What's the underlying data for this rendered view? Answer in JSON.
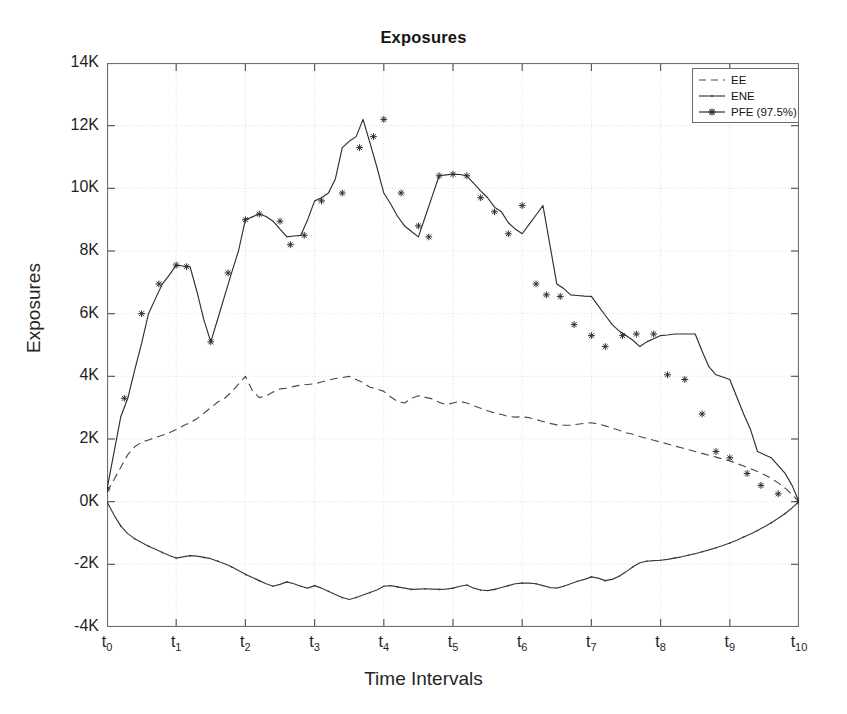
{
  "chart_data": {
    "type": "line",
    "title": "Exposures",
    "xlabel": "Time Intervals",
    "ylabel": "Exposures",
    "grid": true,
    "legend_position": "upper-right",
    "ylim": [
      -4000,
      14000
    ],
    "ytick_values": [
      -4000,
      -2000,
      0,
      2000,
      4000,
      6000,
      8000,
      10000,
      12000,
      14000
    ],
    "ytick_labels": [
      "-4K",
      "-2K",
      "0K",
      "2K",
      "4K",
      "6K",
      "8K",
      "10K",
      "12K",
      "14K"
    ],
    "xlim": [
      0,
      10
    ],
    "xtick_values": [
      0,
      1,
      2,
      3,
      4,
      5,
      6,
      7,
      8,
      9,
      10
    ],
    "xtick_labels": [
      "t0",
      "t1",
      "t2",
      "t3",
      "t4",
      "t5",
      "t6",
      "t7",
      "t8",
      "t9",
      "t10"
    ],
    "xtick_bases": [
      "t",
      "t",
      "t",
      "t",
      "t",
      "t",
      "t",
      "t",
      "t",
      "t",
      "t"
    ],
    "xtick_subs": [
      "0",
      "1",
      "2",
      "3",
      "4",
      "5",
      "6",
      "7",
      "8",
      "9",
      "10"
    ],
    "x": [
      0.0,
      0.1,
      0.2,
      0.3,
      0.4,
      0.5,
      0.6,
      0.7,
      0.8,
      0.9,
      1.0,
      1.1,
      1.2,
      1.3,
      1.4,
      1.5,
      1.6,
      1.7,
      1.8,
      1.9,
      2.0,
      2.1,
      2.2,
      2.3,
      2.4,
      2.5,
      2.6,
      2.7,
      2.8,
      2.9,
      3.0,
      3.1,
      3.2,
      3.3,
      3.4,
      3.5,
      3.6,
      3.7,
      3.8,
      3.9,
      4.0,
      4.1,
      4.2,
      4.3,
      4.4,
      4.5,
      4.6,
      4.7,
      4.8,
      4.9,
      5.0,
      5.1,
      5.2,
      5.3,
      5.4,
      5.5,
      5.6,
      5.7,
      5.8,
      5.9,
      6.0,
      6.1,
      6.2,
      6.3,
      6.4,
      6.5,
      6.6,
      6.7,
      6.8,
      6.9,
      7.0,
      7.1,
      7.2,
      7.3,
      7.4,
      7.5,
      7.6,
      7.7,
      7.8,
      7.9,
      8.0,
      8.1,
      8.2,
      8.3,
      8.4,
      8.5,
      8.6,
      8.7,
      8.8,
      8.9,
      9.0,
      9.1,
      9.2,
      9.3,
      9.4,
      9.5,
      9.6,
      9.7,
      9.8,
      9.9,
      10.0
    ],
    "series": [
      {
        "name": "EE",
        "style": "dashed",
        "marker": "none",
        "color": "#4a4a4a",
        "values": [
          300,
          700,
          1100,
          1500,
          1750,
          1900,
          1970,
          2050,
          2120,
          2200,
          2300,
          2420,
          2520,
          2650,
          2820,
          3000,
          3180,
          3300,
          3500,
          3750,
          4000,
          3550,
          3320,
          3380,
          3500,
          3600,
          3620,
          3680,
          3720,
          3740,
          3760,
          3820,
          3880,
          3930,
          3960,
          4000,
          3900,
          3800,
          3650,
          3600,
          3520,
          3340,
          3200,
          3150,
          3300,
          3380,
          3330,
          3280,
          3170,
          3100,
          3150,
          3200,
          3150,
          3060,
          2980,
          2900,
          2830,
          2780,
          2720,
          2700,
          2710,
          2680,
          2620,
          2560,
          2500,
          2450,
          2440,
          2440,
          2470,
          2500,
          2520,
          2480,
          2420,
          2350,
          2280,
          2200,
          2150,
          2080,
          2020,
          1960,
          1900,
          1840,
          1780,
          1720,
          1660,
          1600,
          1540,
          1480,
          1420,
          1360,
          1300,
          1220,
          1140,
          1050,
          960,
          860,
          740,
          600,
          430,
          230,
          0
        ]
      },
      {
        "name": "ENE",
        "style": "solid",
        "marker": "none",
        "color": "#3a3a3a",
        "values": [
          0,
          -420,
          -780,
          -1020,
          -1180,
          -1300,
          -1420,
          -1520,
          -1620,
          -1720,
          -1800,
          -1760,
          -1720,
          -1740,
          -1780,
          -1820,
          -1900,
          -1980,
          -2080,
          -2200,
          -2320,
          -2420,
          -2520,
          -2620,
          -2700,
          -2640,
          -2560,
          -2620,
          -2700,
          -2760,
          -2680,
          -2760,
          -2860,
          -2960,
          -3060,
          -3120,
          -3060,
          -2980,
          -2900,
          -2820,
          -2700,
          -2680,
          -2720,
          -2760,
          -2800,
          -2790,
          -2780,
          -2790,
          -2800,
          -2790,
          -2760,
          -2700,
          -2660,
          -2760,
          -2820,
          -2840,
          -2800,
          -2740,
          -2680,
          -2620,
          -2600,
          -2600,
          -2620,
          -2680,
          -2740,
          -2760,
          -2700,
          -2620,
          -2540,
          -2480,
          -2400,
          -2440,
          -2520,
          -2480,
          -2380,
          -2240,
          -2080,
          -1950,
          -1900,
          -1880,
          -1870,
          -1840,
          -1800,
          -1760,
          -1710,
          -1660,
          -1600,
          -1540,
          -1470,
          -1400,
          -1320,
          -1230,
          -1130,
          -1030,
          -920,
          -800,
          -670,
          -530,
          -380,
          -200,
          0
        ]
      },
      {
        "name": "PFE (97.5%)",
        "style": "solid",
        "marker": "star",
        "color": "#2e2e2e",
        "marker_x": [
          0.0,
          0.25,
          0.5,
          0.75,
          1.0,
          1.15,
          1.5,
          1.75,
          2.0,
          2.2,
          2.5,
          2.65,
          2.85,
          3.1,
          3.4,
          3.65,
          3.85,
          4.0,
          4.25,
          4.5,
          4.65,
          4.8,
          5.0,
          5.2,
          5.4,
          5.6,
          5.8,
          6.0,
          6.2,
          6.35,
          6.55,
          6.75,
          7.0,
          7.2,
          7.45,
          7.65,
          7.9,
          8.1,
          8.35,
          8.6,
          8.8,
          9.0,
          9.25,
          9.45,
          9.7,
          10.0
        ],
        "marker_values": [
          400,
          3300,
          6000,
          6950,
          7550,
          7500,
          5100,
          7300,
          9000,
          9180,
          8950,
          8200,
          8500,
          9600,
          9850,
          11300,
          11650,
          12200,
          9850,
          8800,
          8450,
          10400,
          10450,
          10400,
          9700,
          9250,
          8550,
          9450,
          6950,
          6600,
          6550,
          5650,
          5300,
          4950,
          5300,
          5350,
          5350,
          4050,
          3900,
          2800,
          1600,
          1400,
          900,
          520,
          250,
          0
        ],
        "values": [
          400,
          1560,
          2720,
          3300,
          4200,
          5050,
          6000,
          6480,
          6950,
          7230,
          7550,
          7520,
          7500,
          6700,
          5800,
          5100,
          5830,
          6570,
          7300,
          8000,
          9000,
          9090,
          9180,
          9100,
          8950,
          8700,
          8450,
          8480,
          8500,
          9000,
          9600,
          9700,
          9850,
          10300,
          11300,
          11500,
          11650,
          12200,
          11450,
          10680,
          9850,
          9500,
          9100,
          8800,
          8620,
          8450,
          9100,
          9750,
          10400,
          10430,
          10450,
          10440,
          10400,
          10160,
          9920,
          9700,
          9400,
          9250,
          8900,
          8700,
          8550,
          8850,
          9150,
          9450,
          8200,
          6950,
          6800,
          6600,
          6580,
          6560,
          6550,
          6250,
          5950,
          5650,
          5450,
          5300,
          5150,
          4950,
          5100,
          5200,
          5300,
          5320,
          5350,
          5350,
          5350,
          5350,
          4800,
          4300,
          4050,
          3980,
          3900,
          3350,
          2800,
          2300,
          1600,
          1500,
          1400,
          1150,
          900,
          520,
          0
        ]
      }
    ]
  },
  "legend": {
    "items": [
      {
        "label": "EE",
        "sample": "dashed-line"
      },
      {
        "label": "ENE",
        "sample": "solid-line"
      },
      {
        "label": "PFE (97.5%)",
        "sample": "solid-line-star-marker"
      }
    ]
  }
}
